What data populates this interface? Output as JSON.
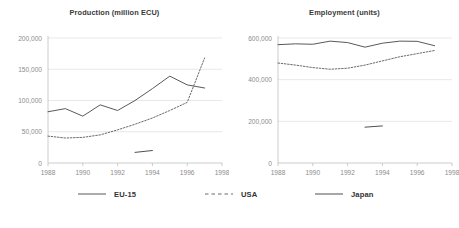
{
  "legend": {
    "position": "bottom",
    "items": [
      {
        "label": "EU-15",
        "style": "solid",
        "color": "#595959"
      },
      {
        "label": "USA",
        "style": "dashed",
        "color": "#6b6b6b"
      },
      {
        "label": "Japan",
        "style": "solid",
        "color": "#4f4f4f"
      }
    ]
  },
  "chart_data": [
    {
      "type": "line",
      "title": "Production (million ECU)",
      "xlabel": "",
      "ylabel": "",
      "xlim": [
        1988,
        1998
      ],
      "ylim": [
        0,
        200000
      ],
      "xticks": [
        1988,
        1990,
        1992,
        1994,
        1996,
        1998
      ],
      "xtick_labels": [
        "1988",
        "1990",
        "1992",
        "1994",
        "1996",
        "1998"
      ],
      "yticks": [
        0,
        50000,
        100000,
        150000,
        200000
      ],
      "ytick_labels": [
        "0",
        "50,000",
        "100,000",
        "150,000",
        "200,000"
      ],
      "grid": "horizontal",
      "series": [
        {
          "name": "EU-15",
          "style": "solid",
          "color": "#595959",
          "x": [
            1988,
            1989,
            1990,
            1991,
            1992,
            1993,
            1994,
            1995,
            1996,
            1997
          ],
          "values": [
            82000,
            87000,
            75000,
            93000,
            84000,
            100000,
            119000,
            139000,
            125000,
            120000
          ]
        },
        {
          "name": "USA",
          "style": "dashed",
          "color": "#6b6b6b",
          "x": [
            1988,
            1989,
            1990,
            1991,
            1992,
            1993,
            1994,
            1995,
            1996,
            1997
          ],
          "values": [
            43000,
            40000,
            41000,
            45000,
            53000,
            62000,
            72000,
            84000,
            97000,
            168000
          ]
        },
        {
          "name": "Japan",
          "style": "solid",
          "color": "#4f4f4f",
          "x": [
            1993,
            1994
          ],
          "values": [
            17000,
            20000
          ]
        }
      ]
    },
    {
      "type": "line",
      "title": "Employment (units)",
      "xlabel": "",
      "ylabel": "",
      "xlim": [
        1988,
        1998
      ],
      "ylim": [
        0,
        600000
      ],
      "xticks": [
        1988,
        1990,
        1992,
        1994,
        1996,
        1998
      ],
      "xtick_labels": [
        "1988",
        "1990",
        "1992",
        "1994",
        "1996",
        "1998"
      ],
      "yticks": [
        0,
        200000,
        400000,
        600000
      ],
      "ytick_labels": [
        "0",
        "200,000",
        "400,000",
        "600,000"
      ],
      "grid": "horizontal",
      "series": [
        {
          "name": "EU-15",
          "style": "solid",
          "color": "#595959",
          "x": [
            1988,
            1989,
            1990,
            1991,
            1992,
            1993,
            1994,
            1995,
            1996,
            1997
          ],
          "values": [
            568000,
            572000,
            570000,
            585000,
            578000,
            556000,
            575000,
            585000,
            584000,
            563000
          ]
        },
        {
          "name": "USA",
          "style": "dashed",
          "color": "#6b6b6b",
          "x": [
            1988,
            1989,
            1990,
            1991,
            1992,
            1993,
            1994,
            1995,
            1996,
            1997
          ],
          "values": [
            480000,
            470000,
            458000,
            450000,
            455000,
            470000,
            490000,
            510000,
            525000,
            540000
          ]
        },
        {
          "name": "Japan",
          "style": "solid",
          "color": "#4f4f4f",
          "x": [
            1993,
            1994
          ],
          "values": [
            172000,
            178000
          ]
        }
      ]
    }
  ]
}
